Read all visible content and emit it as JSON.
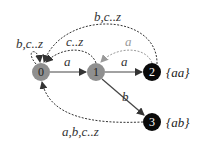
{
  "diagram": {
    "type": "automaton",
    "colors": {
      "initial_state": "#8f8f8f",
      "accept_state": "#0a0a0a",
      "solid_edge": "#444444",
      "dashed_edge": "#333333",
      "faint_edge": "#9a9a9a"
    },
    "states": [
      {
        "id": "0",
        "label": "0",
        "kind": "non-accepting"
      },
      {
        "id": "1",
        "label": "1",
        "kind": "non-accepting"
      },
      {
        "id": "2",
        "label": "2",
        "kind": "accepting",
        "output": "{aa}"
      },
      {
        "id": "3",
        "label": "3",
        "kind": "accepting",
        "output": "{ab}"
      }
    ],
    "transitions": [
      {
        "from": "0",
        "to": "0",
        "label": "b,c..z",
        "style": "dashed"
      },
      {
        "from": "0",
        "to": "1",
        "label": "a",
        "style": "solid"
      },
      {
        "from": "1",
        "to": "2",
        "label": "a",
        "style": "solid"
      },
      {
        "from": "1",
        "to": "3",
        "label": "b",
        "style": "solid"
      },
      {
        "from": "1",
        "to": "0",
        "label": "c..z",
        "style": "dashed"
      },
      {
        "from": "2",
        "to": "1",
        "label": "a",
        "style": "dashed-faint"
      },
      {
        "from": "2",
        "to": "0",
        "label": "b,c..z",
        "style": "dashed"
      },
      {
        "from": "3",
        "to": "0",
        "label": "a,b,c..z",
        "style": "dashed"
      }
    ]
  }
}
